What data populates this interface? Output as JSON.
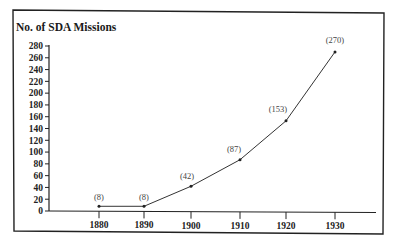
{
  "chart_data": {
    "type": "line",
    "title": "No. of SDA Missions",
    "xlabel": "",
    "ylabel": "No. of SDA Missions",
    "x": [
      1880,
      1890,
      1900,
      1910,
      1920,
      1930
    ],
    "categories": [
      "1880",
      "1890",
      "1900",
      "1910",
      "1920",
      "1930"
    ],
    "series": [
      {
        "name": "SDA Missions",
        "values": [
          8,
          8,
          42,
          87,
          153,
          270
        ]
      }
    ],
    "data_labels": [
      "(8)",
      "(8)",
      "(42)",
      "(87)",
      "(153)",
      "(270)"
    ],
    "ylim": [
      0,
      280
    ],
    "yticks": [
      0,
      20,
      40,
      60,
      80,
      100,
      120,
      140,
      160,
      180,
      200,
      220,
      240,
      260,
      280
    ],
    "grid": false,
    "legend": "none",
    "line_color": "#333333"
  },
  "colors": {
    "frame": "#222222",
    "axis": "#222222",
    "line": "#333333",
    "label": "#444444"
  }
}
